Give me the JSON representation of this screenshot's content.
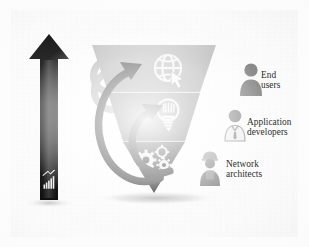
{
  "diagram": {
    "type": "inverted-funnel",
    "title_text": "",
    "growth_arrow": {
      "icon": "bar-chart-icon",
      "direction": "up",
      "label": ""
    },
    "tiers": [
      {
        "id": "tier-end-users",
        "icon": "globe-cursor-icon",
        "audience_label_line1": "End",
        "audience_label_line2": "users",
        "audience_icon": "person-icon",
        "fill_top": "#b9b9b9",
        "fill_bottom": "#9a9a9a"
      },
      {
        "id": "tier-application-developers",
        "icon": "lightbulb-icon",
        "audience_label_line1": "Application",
        "audience_label_line2": "developers",
        "audience_icon": "person-shirt-tie-icon",
        "fill_top": "#8c8c8c",
        "fill_bottom": "#6e6e6e"
      },
      {
        "id": "tier-network-architects",
        "icon": "gears-icon",
        "audience_label_line1": "Network",
        "audience_label_line2": "architects",
        "audience_icon": "person-hardhat-icon",
        "fill_top": "#4b4b4b",
        "fill_bottom": "#1d1d1d"
      }
    ],
    "feedback_arrows": {
      "count": 2,
      "direction": "counter-clockwise-upward",
      "color": "#3a3a3a"
    },
    "decor_arcs": {
      "count": 2,
      "color": "#b0b0b0"
    },
    "colors": {
      "background": "#fdfdfd",
      "panel": "#f6f6f6",
      "arrow_dark": "#1c1c1c",
      "arrow_light": "#6a6a6a",
      "text": "#2e2e2e",
      "person_icon": "#8f8f8f",
      "shadow": "#c8c8c8"
    }
  }
}
